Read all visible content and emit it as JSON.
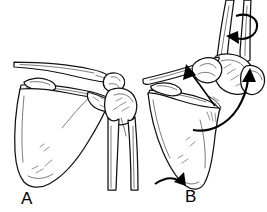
{
  "figure": {
    "background_color": "#ffffff",
    "line_color": "#111111",
    "width": 267,
    "height": 212
  },
  "panels": [
    {
      "id": "panel-a",
      "label": "A",
      "caption": "Arm at side, scapula resting",
      "structures": [
        "clavicle",
        "acromion",
        "coracoid-process",
        "scapula-spine",
        "scapula-body",
        "glenoid",
        "humerus-head",
        "humerus-shaft"
      ],
      "arrows": []
    },
    {
      "id": "panel-b",
      "label": "B",
      "caption": "Arm elevated, scapula upwardly rotated",
      "structures": [
        "clavicle",
        "acromion",
        "coracoid-process",
        "scapula-spine",
        "scapula-body",
        "glenoid",
        "humerus-head",
        "humerus-shaft"
      ],
      "arrows": [
        {
          "name": "humeral-rotation-arrow",
          "type": "curved-rotation",
          "position": "proximal-humeral-shaft-top"
        },
        {
          "name": "acromion-pointer-arrow",
          "type": "straight-pointer",
          "position": "acromioclavicular-region"
        },
        {
          "name": "arm-elevation-arrow",
          "type": "large-curved-sweep",
          "position": "lateral-humerus"
        },
        {
          "name": "scapular-rotation-arrow",
          "type": "curved-hook",
          "position": "inferior-scapular-angle"
        }
      ]
    }
  ],
  "labels": {
    "a": "A",
    "b": "B"
  }
}
